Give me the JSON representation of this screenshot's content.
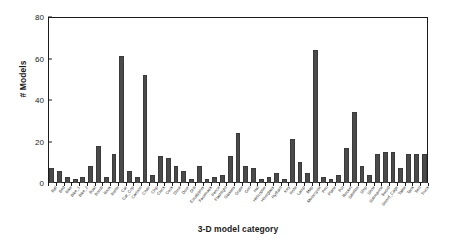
{
  "chart_data": {
    "type": "bar",
    "title": "",
    "xlabel": "3-D model category",
    "ylabel": "# Models",
    "ylim": [
      0,
      80
    ],
    "yticks": [
      0,
      20,
      40,
      60,
      80
    ],
    "grid": false,
    "legend_position": "none",
    "bar_color": "#4a4a4a",
    "axis_color": "#1b1b1b",
    "xtick_rotation": -52,
    "categories": [
      "Ball",
      "Bed",
      "Bike",
      "Bike_1",
      "Bike_2",
      "Boat",
      "Bomb",
      "Book",
      "Bottle",
      "Car",
      "Car_Cop",
      "Cartoon",
      "Chair",
      "Chip",
      "Clock",
      "Cock",
      "Dime",
      "Door",
      "Drill",
      "Eucalyptus",
      "Facemask",
      "Fence",
      "Flashlight",
      "Glasses",
      "Grate",
      "Gun",
      "Hat",
      "Helicopter",
      "Hourglass",
      "Hydrant",
      "Key",
      "Knife",
      "Lamp",
      "Map",
      "Motorcycle",
      "Pen",
      "Plane",
      "Pot",
      "Rocket",
      "Satellite",
      "Ship",
      "Shoe",
      "Submarine",
      "Sword",
      "Sword_Cage",
      "Table",
      "Tank",
      "Tent",
      "Truck"
    ],
    "values": [
      7,
      6,
      3,
      2,
      3,
      8,
      18,
      3,
      14,
      61,
      6,
      3,
      52,
      4,
      13,
      12,
      8,
      6,
      2,
      8,
      2,
      3,
      4,
      13,
      24,
      8,
      7,
      2,
      3,
      5,
      2,
      21,
      10,
      5,
      64,
      3,
      2,
      4,
      17,
      34,
      8,
      4,
      14,
      15,
      15,
      7,
      14,
      14,
      14
    ]
  },
  "axes": {
    "ytick_labels": [
      "0",
      "20",
      "40",
      "60",
      "80"
    ],
    "y_axis_title": "# Models",
    "x_axis_title": "3-D model category"
  }
}
